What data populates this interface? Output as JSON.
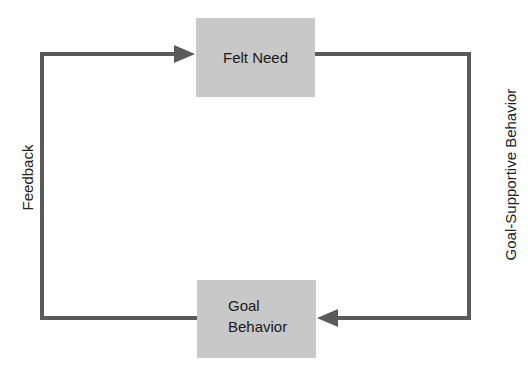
{
  "diagram": {
    "type": "feedback-loop",
    "nodes": [
      {
        "id": "felt-need",
        "label": "Felt Need"
      },
      {
        "id": "goal-behavior",
        "label_lines": [
          "Goal",
          "Behavior"
        ]
      }
    ],
    "edges": [
      {
        "from": "felt-need",
        "to": "goal-behavior",
        "label": "Goal-Supportive Behavior",
        "side": "right"
      },
      {
        "from": "goal-behavior",
        "to": "felt-need",
        "label": "Feedback",
        "side": "left"
      }
    ],
    "colors": {
      "box_fill": "#c8c8c8",
      "line": "#5a5a5a",
      "text": "#1a1a1a"
    }
  }
}
